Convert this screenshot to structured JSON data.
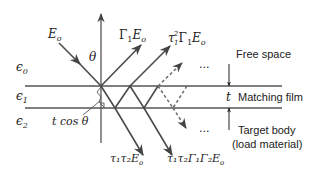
{
  "diagram": {
    "media": {
      "eps0": "ϵ",
      "eps0_sub": "0",
      "eps1": "ϵ",
      "eps1_sub": "1",
      "eps2": "ϵ",
      "eps2_sub": "2"
    },
    "labels": {
      "incident": "E",
      "incident_sub": "o",
      "theta": "θ",
      "reflect1_gamma": "Γ",
      "reflect1_sub": "1",
      "reflect1_E": "E",
      "reflect1_Esub": "o",
      "reflect2_tau": "τ",
      "reflect2_tau_sup": "2",
      "reflect2_tau_sub": "1",
      "reflect2_gamma": "Γ",
      "reflect2_gamma_sub": "1",
      "reflect2_E": "E",
      "reflect2_Esub": "o",
      "ellipsis_top": "...",
      "ellipsis_bottom": "...",
      "thickness": "t",
      "tcos": "t cos θ",
      "trans1": "τ₁τ₂E",
      "trans1_sub": "o",
      "trans2": "τ₁τ₂Γ₁Γ₂E",
      "trans2_sub": "o"
    },
    "annotations": {
      "free_space": "Free space",
      "matching_film": "Matching film",
      "target_body": "Target body",
      "load_material": "(load material)"
    }
  }
}
